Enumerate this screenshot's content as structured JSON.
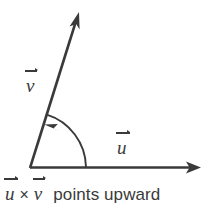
{
  "figure": {
    "name": "vector-cross-product-diagram",
    "background_color": "#ffffff",
    "stroke_color": "#3a3a3a",
    "width": 219,
    "height": 218
  },
  "vectors": {
    "u": {
      "symbol": "u",
      "label": "u",
      "description": "horizontal vector pointing right",
      "origin": [
        30,
        168
      ],
      "tip": [
        201,
        167
      ],
      "label_position": [
        117,
        138
      ]
    },
    "v": {
      "symbol": "v",
      "label": "v",
      "description": "slanted vector pointing up and to the right",
      "origin": [
        30,
        168
      ],
      "tip": [
        79,
        12
      ],
      "angle_degrees": 72.5,
      "label_position": [
        26,
        76
      ]
    }
  },
  "angle_arc": {
    "name": "angle-arc-u-to-v",
    "description": "counterclockwise arc from u to v indicating rotation direction",
    "center": [
      30,
      168
    ],
    "radius": 56,
    "start_angle_degrees": 0,
    "end_angle_degrees": 72.5,
    "arrow_at": "v"
  },
  "caption": {
    "vector_u": "u",
    "cross_symbol": "×",
    "vector_v": "v",
    "text": "points upward",
    "full_text": "u × v points upward"
  }
}
